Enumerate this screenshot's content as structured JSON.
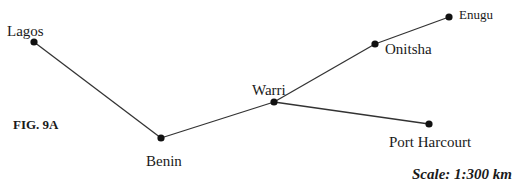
{
  "figure": {
    "label": "FIG. 9A",
    "scale": "Scale: 1:300 km"
  },
  "colors": {
    "line": "#333333",
    "node": "#111111",
    "text": "#1a1a1a"
  },
  "nodes": [
    {
      "id": "lagos",
      "name": "Lagos",
      "x": 34,
      "y": 42
    },
    {
      "id": "benin",
      "name": "Benin",
      "x": 161,
      "y": 138
    },
    {
      "id": "warri",
      "name": "Warri",
      "x": 274,
      "y": 102
    },
    {
      "id": "onitsha",
      "name": "Onitsha",
      "x": 375,
      "y": 44
    },
    {
      "id": "enugu",
      "name": "Enugu",
      "x": 449,
      "y": 17
    },
    {
      "id": "port_harcourt",
      "name": "Port Harcourt",
      "x": 429,
      "y": 124
    }
  ],
  "edges": [
    {
      "from": "Lagos",
      "to": "Benin"
    },
    {
      "from": "Benin",
      "to": "Warri"
    },
    {
      "from": "Warri",
      "to": "Onitsha"
    },
    {
      "from": "Onitsha",
      "to": "Enugu"
    },
    {
      "from": "Warri",
      "to": "Port Harcourt"
    }
  ]
}
